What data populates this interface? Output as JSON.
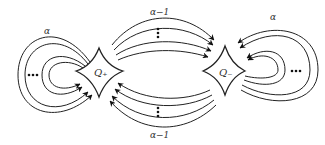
{
  "diagram": {
    "nodes": [
      {
        "id": "q_plus",
        "label": "Q₊"
      },
      {
        "id": "q_minus",
        "label": "Q₋"
      }
    ],
    "edge_groups": [
      {
        "id": "loop-left",
        "label": "α",
        "from": "q_plus",
        "to": "q_plus",
        "direction": "loop",
        "ellipsis": "..."
      },
      {
        "id": "top-bundle",
        "label": "α−1",
        "from": "q_plus",
        "to": "q_minus",
        "direction": "left-to-right",
        "ellipsis": "⋮"
      },
      {
        "id": "bottom-bundle",
        "label": "α−1",
        "from": "q_minus",
        "to": "q_plus",
        "direction": "right-to-left",
        "ellipsis": "⋮"
      },
      {
        "id": "loop-right",
        "label": "α",
        "from": "q_minus",
        "to": "q_minus",
        "direction": "loop",
        "ellipsis": "..."
      }
    ],
    "colors": {
      "stroke": "#222222",
      "background": "#ffffff"
    }
  }
}
